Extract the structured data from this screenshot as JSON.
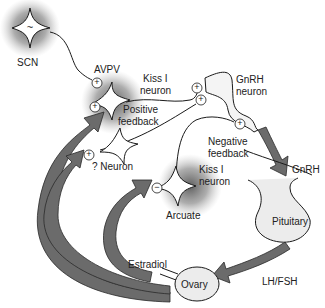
{
  "labels": {
    "scn": "SCN",
    "avpv": "AVPV",
    "kiss_top_1": "Kiss I",
    "kiss_top_2": "neuron",
    "gnrh_neuron_1": "GnRH",
    "gnrh_neuron_2": "neuron",
    "positive_1": "Positive",
    "positive_2": "feedback",
    "negative_1": "Negative",
    "negative_2": "feedback",
    "unknown_neuron": "? Neuron",
    "kiss_arc_1": "Kiss I",
    "kiss_arc_2": "neuron",
    "arcuate": "Arcuate",
    "gnrh": "GnRH",
    "pituitary": "Pituitary",
    "lhfsh": "LH/FSH",
    "estradiol": "Estradiol",
    "ovary": "Ovary"
  },
  "symbols": {
    "plus": "+",
    "minus": "−",
    "scn_wave": "~"
  },
  "colors": {
    "arrow_fill": "#6b6b6b",
    "arrow_stroke": "#2a2a2a",
    "glow": "#555555",
    "organ_fill": "#ececec",
    "line": "#1a1a1a"
  }
}
